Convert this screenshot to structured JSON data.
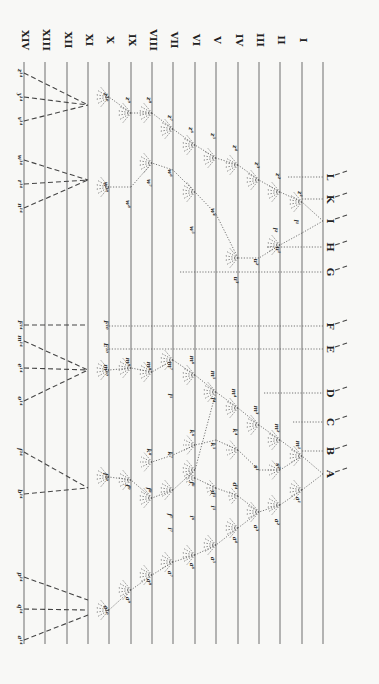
{
  "colors": {
    "background": "#f8f8f6",
    "lines": "#7a7a7a",
    "text": "#222222"
  },
  "generations": {
    "labels": [
      "XIV",
      "XIII",
      "XII",
      "XI",
      "X",
      "IX",
      "VIII",
      "VII",
      "VI",
      "V",
      "IV",
      "III",
      "II",
      "I"
    ],
    "x": [
      24,
      45,
      67,
      88,
      109,
      131,
      152,
      173,
      195,
      216,
      238,
      259,
      280,
      302
    ],
    "baseline_x": 323
  },
  "species": {
    "labels": [
      "L",
      "K",
      "I",
      "H",
      "G",
      "F",
      "E",
      "D",
      "C",
      "B",
      "A"
    ],
    "y": [
      177,
      199,
      221,
      247,
      272,
      326,
      349,
      393,
      422,
      451,
      474
    ]
  },
  "gen_x_labels": [
    {
      "text": "z¹⁰",
      "y": 97
    },
    {
      "text": "w¹⁰",
      "y": 187
    },
    {
      "text": "F¹⁰",
      "y": 325
    },
    {
      "text": "E¹⁰",
      "y": 348
    },
    {
      "text": "m¹⁰",
      "y": 370
    },
    {
      "text": "f¹⁰",
      "y": 477
    },
    {
      "text": "a¹⁰",
      "y": 610
    }
  ],
  "gen_xiv_labels": [
    {
      "text": "z¹⁴",
      "y": 73
    },
    {
      "text": "y¹⁴",
      "y": 97
    },
    {
      "text": "v¹⁴",
      "y": 121
    },
    {
      "text": "w¹⁴",
      "y": 160
    },
    {
      "text": "r¹⁴",
      "y": 184
    },
    {
      "text": "n¹⁴",
      "y": 208
    },
    {
      "text": "F¹⁴",
      "y": 325
    },
    {
      "text": "m¹⁴",
      "y": 341
    },
    {
      "text": "e¹⁴",
      "y": 368
    },
    {
      "text": "o¹⁴",
      "y": 401
    },
    {
      "text": "f¹⁴",
      "y": 452
    },
    {
      "text": "b¹⁴",
      "y": 494
    },
    {
      "text": "p¹⁴",
      "y": 577
    },
    {
      "text": "q¹⁴",
      "y": 609
    },
    {
      "text": "a¹⁴",
      "y": 640
    }
  ],
  "inner_labels": [
    {
      "t": "z¹",
      "x": 298,
      "y": 194
    },
    {
      "t": "z²",
      "x": 276,
      "y": 176
    },
    {
      "t": "z³",
      "x": 255,
      "y": 165
    },
    {
      "t": "z⁴",
      "x": 233,
      "y": 148
    },
    {
      "t": "z⁵",
      "x": 211,
      "y": 136
    },
    {
      "t": "z⁶",
      "x": 189,
      "y": 130
    },
    {
      "t": "z⁷",
      "x": 168,
      "y": 118
    },
    {
      "t": "z⁸",
      "x": 147,
      "y": 100
    },
    {
      "t": "z⁹",
      "x": 126,
      "y": 100
    },
    {
      "t": "l¹",
      "x": 294,
      "y": 222
    },
    {
      "t": "l²",
      "x": 273,
      "y": 230
    },
    {
      "t": "u¹",
      "x": 276,
      "y": 250
    },
    {
      "t": "u²",
      "x": 254,
      "y": 262
    },
    {
      "t": "u³",
      "x": 234,
      "y": 280
    },
    {
      "t": "w⁴",
      "x": 211,
      "y": 212
    },
    {
      "t": "w⁵",
      "x": 190,
      "y": 230
    },
    {
      "t": "w⁶",
      "x": 168,
      "y": 173
    },
    {
      "t": "w⁷",
      "x": 147,
      "y": 183
    },
    {
      "t": "w⁸",
      "x": 126,
      "y": 204
    },
    {
      "t": "m¹",
      "x": 296,
      "y": 445
    },
    {
      "t": "m²",
      "x": 275,
      "y": 428
    },
    {
      "t": "m³",
      "x": 254,
      "y": 410
    },
    {
      "t": "m⁴",
      "x": 232,
      "y": 393
    },
    {
      "t": "m⁵",
      "x": 211,
      "y": 375
    },
    {
      "t": "m⁶",
      "x": 190,
      "y": 360
    },
    {
      "t": "m⁷",
      "x": 168,
      "y": 366
    },
    {
      "t": "m⁸",
      "x": 147,
      "y": 366
    },
    {
      "t": "m⁹",
      "x": 126,
      "y": 362
    },
    {
      "t": "s²",
      "x": 276,
      "y": 466
    },
    {
      "t": "s¹",
      "x": 254,
      "y": 468
    },
    {
      "t": "l⁴",
      "x": 211,
      "y": 400
    },
    {
      "t": "l⁵",
      "x": 168,
      "y": 396
    },
    {
      "t": "k⁴",
      "x": 233,
      "y": 432
    },
    {
      "t": "k⁵",
      "x": 211,
      "y": 446
    },
    {
      "t": "k⁶",
      "x": 190,
      "y": 433
    },
    {
      "t": "k⁷",
      "x": 168,
      "y": 455
    },
    {
      "t": "k⁸",
      "x": 147,
      "y": 452
    },
    {
      "t": "a¹",
      "x": 296,
      "y": 500
    },
    {
      "t": "a²",
      "x": 275,
      "y": 522
    },
    {
      "t": "a³",
      "x": 254,
      "y": 528
    },
    {
      "t": "a⁴",
      "x": 233,
      "y": 540
    },
    {
      "t": "a⁵",
      "x": 211,
      "y": 560
    },
    {
      "t": "a⁶",
      "x": 190,
      "y": 566
    },
    {
      "t": "a⁷",
      "x": 168,
      "y": 574
    },
    {
      "t": "a⁸",
      "x": 147,
      "y": 582
    },
    {
      "t": "a⁹",
      "x": 126,
      "y": 600
    },
    {
      "t": "d⁴",
      "x": 233,
      "y": 486
    },
    {
      "t": "d⁵",
      "x": 211,
      "y": 494
    },
    {
      "t": "i⁵",
      "x": 211,
      "y": 508
    },
    {
      "t": "i⁶",
      "x": 190,
      "y": 518
    },
    {
      "t": "i⁷",
      "x": 168,
      "y": 530
    },
    {
      "t": "f⁶",
      "x": 190,
      "y": 484
    },
    {
      "t": "f⁷",
      "x": 168,
      "y": 516
    },
    {
      "t": "f⁸",
      "x": 147,
      "y": 490
    },
    {
      "t": "f⁹",
      "x": 126,
      "y": 487
    }
  ]
}
